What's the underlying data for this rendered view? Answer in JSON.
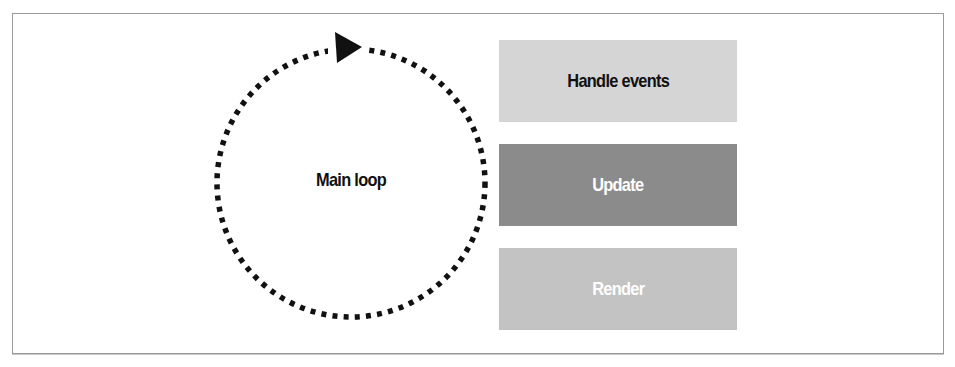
{
  "diagram": {
    "type": "loop-flow",
    "loop": {
      "label": "Main loop",
      "direction": "clockwise",
      "style": "dotted-circle-with-arrowhead"
    },
    "steps": [
      {
        "label": "Handle events",
        "fill": "#d5d5d5",
        "text_color": "#111111"
      },
      {
        "label": "Update",
        "fill": "#8b8b8b",
        "text_color": "#ffffff"
      },
      {
        "label": "Render",
        "fill": "#c3c3c3",
        "text_color": "#ffffff"
      }
    ],
    "colors": {
      "frame_border": "#9a9a9a",
      "dots": "#111111",
      "background": "#ffffff"
    }
  }
}
